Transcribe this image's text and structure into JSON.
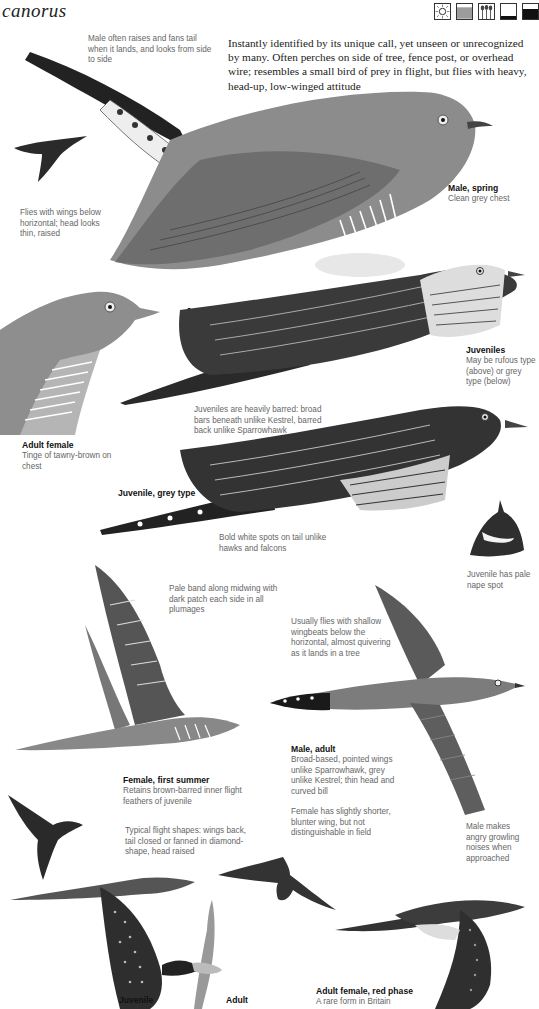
{
  "header": {
    "title": "canorus",
    "habitat_icons": [
      {
        "name": "sun-heath-icon",
        "label": "open sunny habitat"
      },
      {
        "name": "reeds-icon",
        "label": "marsh habitat"
      },
      {
        "name": "trees-icon",
        "label": "woodland habitat"
      },
      {
        "name": "shallow-water-icon",
        "label": "shallow water"
      },
      {
        "name": "deep-water-icon",
        "label": "deep water"
      }
    ]
  },
  "intro": "Instantly identified by its unique call, yet unseen or unrecognized by many. Often perches on side of tree, fence post, or overhead wire; resembles a small bird of prey in flight, but flies with heavy, head-up, low-winged attitude",
  "notes": {
    "male_tail": "Male often raises and fans tail when it lands, and looks from side to side",
    "flies_wings": "Flies with wings below horizontal; head looks thin, raised",
    "juveniles_barred": "Juveniles are heavily barred: broad bars beneath unlike Kestrel, barred back unlike Sparrowhawk",
    "white_spots": "Bold white spots on tail unlike hawks and falcons",
    "nape_spot": "Juvenile has pale nape spot",
    "pale_band": "Pale band along midwing with dark patch each side in all plumages",
    "shallow_wingbeats": "Usually flies with shallow wingbeats below the horizontal, almost quivering as it lands in a tree",
    "female_wing": "Female has slightly shorter, blunter wing, but not distinguishable in field",
    "flight_shapes": "Typical flight shapes: wings back, tail closed or fanned in diamond-shape, head raised",
    "growling": "Male makes angry growling noises when approached"
  },
  "captions": {
    "male_spring": {
      "title": "Male, spring",
      "desc": "Clean grey chest"
    },
    "juv_rufous": {
      "title": "Juvenile, rufous type"
    },
    "juveniles": {
      "title": "Juveniles",
      "desc": "May be rufous type (above) or grey type (below)"
    },
    "adult_female": {
      "title": "Adult female",
      "desc": "Tinge of tawny-brown on chest"
    },
    "juv_grey": {
      "title": "Juvenile, grey type"
    },
    "male_adult": {
      "title": "Male, adult",
      "desc": "Broad-based, pointed wings unlike Sparrowhawk, grey unlike Kestrel; thin head and curved bill"
    },
    "female_first_summer": {
      "title": "Female, first summer",
      "desc": "Retains brown-barred inner flight feathers of juvenile"
    },
    "juvenile_flight": {
      "title": "Juvenile"
    },
    "adult_flight": {
      "title": "Adult"
    },
    "red_phase": {
      "title": "Adult female, red phase",
      "desc": "A rare form in Britain"
    }
  },
  "colors": {
    "grey_plumage": "#8a8a8a",
    "dark_plumage": "#2a2a2a",
    "text_dark": "#111111",
    "text_note": "#666666"
  }
}
